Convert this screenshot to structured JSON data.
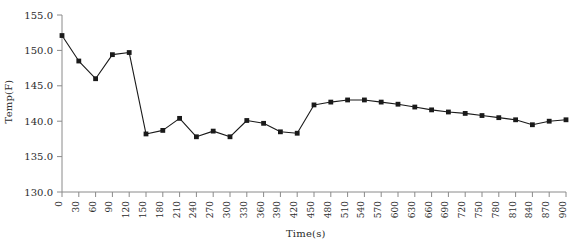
{
  "chart_data": {
    "type": "line",
    "title": "",
    "xlabel": "Time(s)",
    "ylabel": "Temp(F)",
    "xlim": [
      0,
      900
    ],
    "ylim": [
      130.0,
      155.0
    ],
    "grid": false,
    "legend": null,
    "marker": "square",
    "line_color": "#1a1a1a",
    "marker_color": "#1a1a1a",
    "xticks": [
      0,
      30,
      60,
      90,
      120,
      150,
      180,
      210,
      240,
      270,
      300,
      330,
      360,
      390,
      420,
      450,
      480,
      510,
      540,
      570,
      600,
      630,
      660,
      690,
      720,
      750,
      780,
      810,
      840,
      870,
      900
    ],
    "xtick_labels": [
      "0",
      "30",
      "60",
      "90",
      "120",
      "150",
      "180",
      "210",
      "240",
      "270",
      "300",
      "330",
      "360",
      "390",
      "420",
      "450",
      "480",
      "510",
      "540",
      "570",
      "600",
      "630",
      "660",
      "690",
      "720",
      "750",
      "780",
      "810",
      "840",
      "870",
      "900"
    ],
    "yticks": [
      130.0,
      135.0,
      140.0,
      145.0,
      150.0,
      155.0
    ],
    "ytick_labels": [
      "130.0",
      "135.0",
      "140.0",
      "145.0",
      "150.0",
      "155.0"
    ],
    "x": [
      0,
      30,
      60,
      90,
      120,
      150,
      180,
      210,
      240,
      270,
      300,
      330,
      360,
      390,
      420,
      450,
      480,
      510,
      540,
      570,
      600,
      630,
      660,
      690,
      720,
      750,
      780,
      810,
      840,
      870,
      900
    ],
    "values": [
      152.1,
      148.5,
      146.0,
      149.4,
      149.7,
      138.2,
      138.7,
      140.4,
      137.8,
      138.6,
      137.8,
      140.1,
      139.7,
      138.5,
      138.3,
      142.3,
      142.7,
      143.0,
      143.0,
      142.7,
      142.4,
      142.0,
      141.6,
      141.3,
      141.1,
      140.8,
      140.5,
      140.2,
      139.5,
      140.0,
      140.2
    ]
  }
}
